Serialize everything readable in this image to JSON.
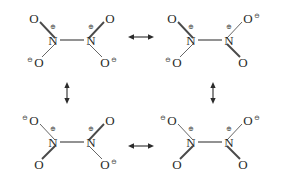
{
  "figure": {
    "kind": "resonance-scheme",
    "molecule": "N2O4",
    "background_color": "#ffffff",
    "atom_color": "#2b2b2b",
    "bond_color": "#4a4a4a",
    "charge_color": "#4a4a4a",
    "glyphs": {
      "nitrogen": "N",
      "oxygen": "O",
      "plus_charge": "⊕",
      "minus_charge": "⊖",
      "horizontal_arrow": "↔",
      "vertical_arrow": "↕"
    }
  },
  "structures": [
    {
      "id": "structure-top-left",
      "position": "top-left",
      "center": {
        "x": 72,
        "y": 38
      },
      "nitrogens": [
        {
          "label": "N",
          "charge": "⊕",
          "side": "left"
        },
        {
          "label": "N",
          "charge": "⊕",
          "side": "right"
        }
      ],
      "oxygens": [
        {
          "label": "O",
          "charge": "",
          "bond": "double",
          "corner": "upper-left"
        },
        {
          "label": "O",
          "charge": "",
          "bond": "double",
          "corner": "upper-right"
        },
        {
          "label": "O",
          "charge": "⊖",
          "bond": "single",
          "corner": "lower-left",
          "charge_side": "left"
        },
        {
          "label": "O",
          "charge": "⊖",
          "bond": "single",
          "corner": "lower-right",
          "charge_side": "right"
        }
      ]
    },
    {
      "id": "structure-top-right",
      "position": "top-right",
      "center": {
        "x": 210,
        "y": 38
      },
      "nitrogens": [
        {
          "label": "N",
          "charge": "⊕",
          "side": "left"
        },
        {
          "label": "N",
          "charge": "⊕",
          "side": "right"
        }
      ],
      "oxygens": [
        {
          "label": "O",
          "charge": "",
          "bond": "double",
          "corner": "upper-left"
        },
        {
          "label": "O",
          "charge": "⊖",
          "bond": "single",
          "corner": "upper-right",
          "charge_side": "right"
        },
        {
          "label": "O",
          "charge": "⊖",
          "bond": "single",
          "corner": "lower-left",
          "charge_side": "left"
        },
        {
          "label": "O",
          "charge": "",
          "bond": "double",
          "corner": "lower-right"
        }
      ]
    },
    {
      "id": "structure-bottom-left",
      "position": "bottom-left",
      "center": {
        "x": 72,
        "y": 140
      },
      "nitrogens": [
        {
          "label": "N",
          "charge": "⊕",
          "side": "left"
        },
        {
          "label": "N",
          "charge": "⊕",
          "side": "right"
        }
      ],
      "oxygens": [
        {
          "label": "O",
          "charge": "⊖",
          "bond": "single",
          "corner": "upper-left",
          "charge_side": "left"
        },
        {
          "label": "O",
          "charge": "",
          "bond": "double",
          "corner": "upper-right"
        },
        {
          "label": "O",
          "charge": "",
          "bond": "double",
          "corner": "lower-left"
        },
        {
          "label": "O",
          "charge": "⊖",
          "bond": "single",
          "corner": "lower-right",
          "charge_side": "right"
        }
      ]
    },
    {
      "id": "structure-bottom-right",
      "position": "bottom-right",
      "center": {
        "x": 210,
        "y": 140
      },
      "nitrogens": [
        {
          "label": "N",
          "charge": "⊕",
          "side": "left"
        },
        {
          "label": "N",
          "charge": "⊕",
          "side": "right"
        }
      ],
      "oxygens": [
        {
          "label": "O",
          "charge": "⊖",
          "bond": "single",
          "corner": "upper-left",
          "charge_side": "left"
        },
        {
          "label": "O",
          "charge": "⊖",
          "bond": "single",
          "corner": "upper-right",
          "charge_side": "right"
        },
        {
          "label": "O",
          "charge": "",
          "bond": "double",
          "corner": "lower-left"
        },
        {
          "label": "O",
          "charge": "",
          "bond": "double",
          "corner": "lower-right"
        }
      ]
    }
  ],
  "arrows": [
    {
      "id": "arrow-top",
      "glyph": "↔",
      "orientation": "horizontal",
      "x": 141,
      "y": 37
    },
    {
      "id": "arrow-bottom",
      "glyph": "↔",
      "orientation": "horizontal",
      "x": 141,
      "y": 146
    },
    {
      "id": "arrow-left",
      "glyph": "↕",
      "orientation": "vertical",
      "x": 67,
      "y": 93
    },
    {
      "id": "arrow-right",
      "glyph": "↕",
      "orientation": "vertical",
      "x": 213,
      "y": 93
    }
  ],
  "labels": {
    "n_left": "N",
    "n_right": "N",
    "oxygen": "O",
    "plus": "⊕",
    "minus": "⊖"
  }
}
